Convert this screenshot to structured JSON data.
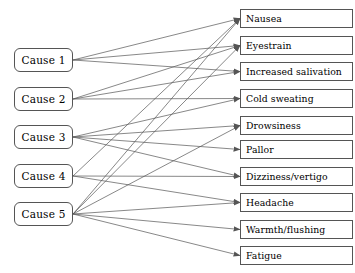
{
  "diagram": {
    "type": "bipartite-graph",
    "colors": {
      "background": "#ffffff",
      "box_border": "#555555",
      "box_fill": "#ffffff",
      "edge": "#555555",
      "text": "#000000"
    },
    "causes": [
      {
        "id": "c1",
        "label": "Cause 1",
        "x": 14,
        "y": 48,
        "w": 59,
        "h": 24
      },
      {
        "id": "c2",
        "label": "Cause 2",
        "x": 14,
        "y": 87,
        "w": 59,
        "h": 24
      },
      {
        "id": "c3",
        "label": "Cause 3",
        "x": 14,
        "y": 125,
        "w": 59,
        "h": 24
      },
      {
        "id": "c4",
        "label": "Cause 4",
        "x": 14,
        "y": 164,
        "w": 59,
        "h": 24
      },
      {
        "id": "c5",
        "label": "Cause 5",
        "x": 14,
        "y": 202,
        "w": 59,
        "h": 24
      }
    ],
    "effects": [
      {
        "id": "e1",
        "label": "Nausea",
        "x": 240,
        "y": 9,
        "w": 113,
        "h": 19
      },
      {
        "id": "e2",
        "label": "Eyestrain",
        "x": 240,
        "y": 36,
        "w": 113,
        "h": 19
      },
      {
        "id": "e3",
        "label": "Increased salivation",
        "x": 240,
        "y": 62,
        "w": 113,
        "h": 19
      },
      {
        "id": "e4",
        "label": "Cold sweating",
        "x": 240,
        "y": 89,
        "w": 113,
        "h": 19
      },
      {
        "id": "e5",
        "label": "Drowsiness",
        "x": 240,
        "y": 116,
        "w": 113,
        "h": 19
      },
      {
        "id": "e6",
        "label": "Pallor",
        "x": 240,
        "y": 140,
        "w": 113,
        "h": 19
      },
      {
        "id": "e7",
        "label": "Dizziness/vertigo",
        "x": 240,
        "y": 167,
        "w": 113,
        "h": 19
      },
      {
        "id": "e8",
        "label": "Headache",
        "x": 240,
        "y": 193,
        "w": 113,
        "h": 19
      },
      {
        "id": "e9",
        "label": "Warmth/flushing",
        "x": 240,
        "y": 220,
        "w": 113,
        "h": 19
      },
      {
        "id": "e10",
        "label": "Fatigue",
        "x": 240,
        "y": 246,
        "w": 113,
        "h": 19
      }
    ],
    "edges": [
      {
        "from": "c1",
        "to": "e1"
      },
      {
        "from": "c1",
        "to": "e2"
      },
      {
        "from": "c1",
        "to": "e3"
      },
      {
        "from": "c2",
        "to": "e2"
      },
      {
        "from": "c2",
        "to": "e3"
      },
      {
        "from": "c2",
        "to": "e4"
      },
      {
        "from": "c3",
        "to": "e4"
      },
      {
        "from": "c3",
        "to": "e5"
      },
      {
        "from": "c3",
        "to": "e6"
      },
      {
        "from": "c3",
        "to": "e7"
      },
      {
        "from": "c4",
        "to": "e1"
      },
      {
        "from": "c4",
        "to": "e7"
      },
      {
        "from": "c4",
        "to": "e8"
      },
      {
        "from": "c5",
        "to": "e1"
      },
      {
        "from": "c5",
        "to": "e2"
      },
      {
        "from": "c5",
        "to": "e5"
      },
      {
        "from": "c5",
        "to": "e8"
      },
      {
        "from": "c5",
        "to": "e9"
      },
      {
        "from": "c5",
        "to": "e10"
      }
    ]
  }
}
